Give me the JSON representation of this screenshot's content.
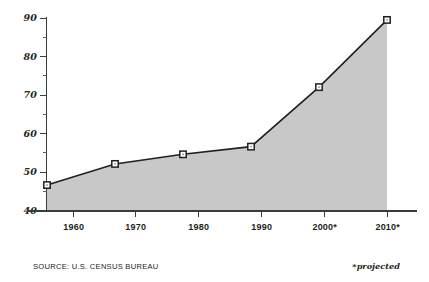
{
  "chart_data": {
    "type": "area",
    "title": "",
    "subtitle": "",
    "xlabel": "",
    "ylabel": "",
    "categories": [
      "1960",
      "1970",
      "1980",
      "1990",
      "2000*",
      "2010*"
    ],
    "values": [
      46.5,
      52,
      54.5,
      56.5,
      72,
      89.5
    ],
    "series": [
      {
        "name": "",
        "values": [
          46.5,
          52,
          54.5,
          56.5,
          72,
          89.5
        ]
      }
    ],
    "ylim": [
      40,
      90
    ],
    "xlim": [
      1960,
      2010
    ],
    "y_major_ticks": [
      40,
      50,
      60,
      70,
      80,
      90
    ],
    "y_minor_ticks": [
      45,
      55,
      65,
      75,
      85
    ],
    "y_tick_labels": [
      "40",
      "50",
      "60",
      "70",
      "80",
      "90"
    ],
    "x_tick_labels": [
      "1960",
      "1970",
      "1980",
      "1990",
      "2000*",
      "2010*"
    ],
    "grid": false,
    "legend": false,
    "legend_position": "none",
    "marker": "open-square",
    "annotations": [
      "SOURCE: U.S. CENSUS BUREAU",
      "*projected"
    ]
  },
  "footer": {
    "source": "SOURCE: U.S. CENSUS BUREAU",
    "projected_note": "*projected"
  },
  "colors": {
    "area_fill": "#c8c8c8",
    "line": "#231f20",
    "axis": "#3b3b3b",
    "marker_fill": "#ffffff",
    "marker_stroke": "#231f20",
    "text": "#231f20",
    "background": "#ffffff"
  }
}
